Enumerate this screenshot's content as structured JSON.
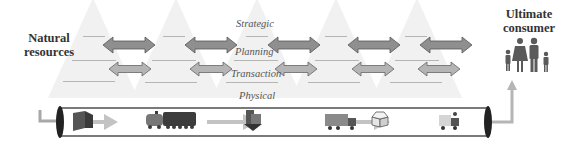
{
  "labels": {
    "source": "Natural\nresources",
    "source_line1": "Natural",
    "source_line2": "resources",
    "sink_line1": "Ultimate",
    "sink_line2": "consumer"
  },
  "levels": [
    "Strategic",
    "Planning",
    "Transaction",
    "Physical"
  ],
  "colors": {
    "planning_arrow": "#8f8f8f",
    "transaction_arrow": "#b4b4b4",
    "pyramid": "#f1f1f1",
    "pipe_border": "#7a7a7a",
    "flow_arrow": "#c3c3c3"
  },
  "stages": 5,
  "physical_flow_icons": [
    "raw-material-block-icon",
    "train-icon",
    "factory-icon",
    "truck-icon",
    "package-box-icon",
    "delivery-van-icon"
  ],
  "consumer_icon": "family-icon"
}
